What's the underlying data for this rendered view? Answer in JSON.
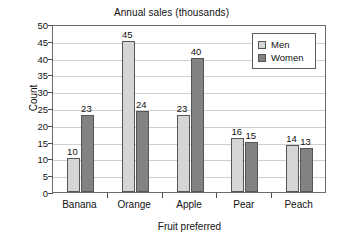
{
  "chart_data": {
    "type": "bar",
    "title": "Annual sales (thousands)",
    "xlabel": "Fruit preferred",
    "ylabel": "Count",
    "categories": [
      "Banana",
      "Orange",
      "Apple",
      "Pear",
      "Peach"
    ],
    "series": [
      {
        "name": "Men",
        "values": [
          10,
          45,
          23,
          16,
          14
        ],
        "color": "#d5d5d5"
      },
      {
        "name": "Women",
        "values": [
          23,
          24,
          40,
          15,
          13
        ],
        "color": "#828282"
      }
    ],
    "ylim": [
      0,
      50
    ],
    "ytick_labels": [
      "0",
      "5",
      "10",
      "15",
      "20",
      "25",
      "30",
      "35",
      "40",
      "45",
      "50"
    ],
    "ytick_step": 5,
    "grid": true,
    "grid_axis": "y",
    "data_labels": true,
    "legend": {
      "position": "top-right",
      "entries": [
        "Men",
        "Women"
      ]
    },
    "plot_border_color": "#6b6b6b",
    "gridline_color": "#cfcfcf",
    "background": "#ffffff"
  }
}
